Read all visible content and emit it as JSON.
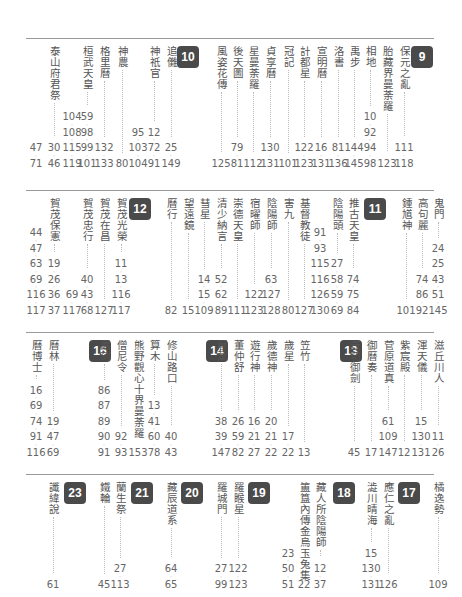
{
  "sections": [
    {
      "top": 38,
      "height": 135,
      "badges": [
        {
          "label": "10",
          "x": 151
        },
        {
          "label": "9",
          "x": 385
        }
      ],
      "entries": [
        {
          "term": "",
          "x": 4,
          "pages": [
            "47",
            "71"
          ]
        },
        {
          "term": "泰山府君祭",
          "x": 22,
          "pages": [
            "30",
            "46"
          ]
        },
        {
          "term": "",
          "x": 40,
          "pages": [
            "104",
            "108",
            "115",
            "119"
          ]
        },
        {
          "term": "桓武天皇",
          "x": 55,
          "pages": [
            "59",
            "98",
            "99",
            "101"
          ]
        },
        {
          "term": "格里曆",
          "x": 72,
          "pages": [
            "132",
            "133"
          ]
        },
        {
          "term": "神農",
          "x": 90,
          "pages": [
            "80"
          ]
        },
        {
          "term": "",
          "x": 106,
          "pages": [
            "95",
            "103",
            "104"
          ]
        },
        {
          "term": "神祇官",
          "x": 122,
          "pages": [
            "12",
            "72",
            "91"
          ]
        },
        {
          "term": "追儺",
          "x": 139,
          "pages": [
            "25",
            "149"
          ]
        },
        {
          "term": "風姿花傳",
          "x": 189,
          "pages": [
            "125"
          ]
        },
        {
          "term": "後天圖",
          "x": 205,
          "pages": [
            "79",
            "81"
          ]
        },
        {
          "term": "星曼荼羅",
          "x": 221,
          "pages": [
            "112"
          ]
        },
        {
          "term": "貞享曆",
          "x": 238,
          "pages": [
            "130",
            "131"
          ]
        },
        {
          "term": "冠記",
          "x": 256,
          "pages": [
            "101"
          ]
        },
        {
          "term": "計都星",
          "x": 272,
          "pages": [
            "122",
            "123"
          ]
        },
        {
          "term": "宣明曆",
          "x": 289,
          "pages": [
            "16",
            "131"
          ]
        },
        {
          "term": "洛書",
          "x": 306,
          "pages": [
            "81",
            "136"
          ]
        },
        {
          "term": "禹步",
          "x": 322,
          "pages": [
            "144",
            "145"
          ]
        },
        {
          "term": "相地",
          "x": 338,
          "pages": [
            "10",
            "92",
            "94",
            "98"
          ]
        },
        {
          "term": "胎藏界曼荼羅",
          "x": 355,
          "pages": [
            "123"
          ]
        },
        {
          "term": "保元之亂",
          "x": 372,
          "pages": [
            "111",
            "118"
          ]
        }
      ]
    },
    {
      "top": 190,
      "height": 130,
      "badges": [
        {
          "label": "12",
          "x": 103
        },
        {
          "label": "11",
          "x": 338
        }
      ],
      "entries": [
        {
          "term": "",
          "x": 4,
          "pages": [
            "44",
            "47",
            "63",
            "69",
            "116",
            "117"
          ]
        },
        {
          "term": "賀茂保憲",
          "x": 22,
          "pages": [
            "19",
            "26",
            "36",
            "37"
          ]
        },
        {
          "term": "",
          "x": 40,
          "pages": [
            "69",
            "117"
          ]
        },
        {
          "term": "賀茂忠行",
          "x": 55,
          "pages": [
            "40",
            "43",
            "68"
          ]
        },
        {
          "term": "賀茂在昌",
          "x": 72,
          "pages": [
            "127"
          ]
        },
        {
          "term": "賀茂光榮",
          "x": 89,
          "pages": [
            "11",
            "13",
            "116",
            "117"
          ]
        },
        {
          "term": "曆行",
          "x": 139,
          "pages": [
            "82"
          ]
        },
        {
          "term": "望遠鏡",
          "x": 156,
          "pages": [
            "15"
          ]
        },
        {
          "term": "彗星",
          "x": 172,
          "pages": [
            "14",
            "15",
            "109"
          ]
        },
        {
          "term": "清少納言",
          "x": 189,
          "pages": [
            "52",
            "62",
            "89"
          ]
        },
        {
          "term": "崇德天皇",
          "x": 205,
          "pages": [
            "111"
          ]
        },
        {
          "term": "宿曜師",
          "x": 222,
          "pages": [
            "122",
            "123"
          ]
        },
        {
          "term": "陰陽師",
          "x": 239,
          "pages": [
            "63",
            "127",
            "128"
          ]
        },
        {
          "term": "害九",
          "x": 256,
          "pages": [
            "80"
          ]
        },
        {
          "term": "基督教徒",
          "x": 272,
          "pages": [
            "127"
          ]
        },
        {
          "term": "",
          "x": 288,
          "pages": [
            "91",
            "93",
            "115",
            "116",
            "126",
            "130"
          ]
        },
        {
          "term": "陰陽頭",
          "x": 305,
          "pages": [
            "27",
            "58",
            "59",
            "69"
          ]
        },
        {
          "term": "推古天皇",
          "x": 321,
          "pages": [
            "74",
            "75",
            "84"
          ]
        },
        {
          "term": "鍾馗神",
          "x": 374,
          "pages": [
            "101"
          ]
        },
        {
          "term": "高句麗",
          "x": 390,
          "pages": [
            "74",
            "86",
            "92"
          ]
        },
        {
          "term": "鬼門",
          "x": 406,
          "pages": [
            "24",
            "25",
            "43",
            "51",
            "145"
          ]
        }
      ]
    },
    {
      "top": 332,
      "height": 130,
      "badges": [
        {
          "label": "16",
          "x": 63
        },
        {
          "label": "14",
          "x": 180
        },
        {
          "label": "13",
          "x": 314
        }
      ],
      "entries": [
        {
          "term": "曆博士",
          "x": 4,
          "pages": [
            "16",
            "69",
            "74",
            "91",
            "116"
          ]
        },
        {
          "term": "曆林",
          "x": 21,
          "pages": [
            "19",
            "47",
            "69"
          ]
        },
        {
          "term": "漏刻",
          "x": 72,
          "pages": [
            "86",
            "87",
            "89",
            "90",
            "91"
          ]
        },
        {
          "term": "僧尼令",
          "x": 89,
          "pages": [
            "92",
            "93"
          ]
        },
        {
          "term": "熊野觀心十界曼荼羅",
          "x": 106,
          "pages": [
            "153"
          ]
        },
        {
          "term": "算木",
          "x": 122,
          "pages": [
            "13",
            "41",
            "60",
            "78"
          ]
        },
        {
          "term": "修山路口",
          "x": 139,
          "pages": [
            "40",
            "43"
          ]
        },
        {
          "term": "曆葉",
          "x": 189,
          "pages": [
            "38",
            "39",
            "147"
          ]
        },
        {
          "term": "董仲舒",
          "x": 206,
          "pages": [
            "26",
            "59",
            "82"
          ]
        },
        {
          "term": "遊行神",
          "x": 222,
          "pages": [
            "16",
            "21",
            "27"
          ]
        },
        {
          "term": "歲德神",
          "x": 239,
          "pages": [
            "20",
            "21",
            "22"
          ]
        },
        {
          "term": "歲星",
          "x": 256,
          "pages": [
            "17",
            "22"
          ]
        },
        {
          "term": "笠竹",
          "x": 272,
          "pages": [
            "13"
          ]
        },
        {
          "term": "壺切御劍",
          "x": 322,
          "pages": [
            "45"
          ]
        },
        {
          "term": "御曆奏",
          "x": 339,
          "pages": [
            "17"
          ]
        },
        {
          "term": "菅原道真",
          "x": 356,
          "pages": [
            "61",
            "109",
            "147"
          ]
        },
        {
          "term": "紫宸殿",
          "x": 372,
          "pages": [
            "12"
          ]
        },
        {
          "term": "渾天儀",
          "x": 389,
          "pages": [
            "15",
            "130",
            "131"
          ]
        },
        {
          "term": "滋丘川人",
          "x": 406,
          "pages": [
            "11",
            "26"
          ]
        }
      ]
    },
    {
      "top": 474,
      "height": 120,
      "badges": [
        {
          "label": "23",
          "x": 38
        },
        {
          "label": "21",
          "x": 105
        },
        {
          "label": "20",
          "x": 155
        },
        {
          "label": "19",
          "x": 222
        },
        {
          "label": "18",
          "x": 307
        },
        {
          "label": "17",
          "x": 372
        }
      ],
      "entries": [
        {
          "term": "讖緯說",
          "x": 21,
          "pages": [
            "61"
          ]
        },
        {
          "term": "鐵輪",
          "x": 72,
          "pages": [
            "45"
          ]
        },
        {
          "term": "蘭生祭",
          "x": 88,
          "pages": [
            "27",
            "113"
          ]
        },
        {
          "term": "藏辰道系",
          "x": 139,
          "pages": [
            "64",
            "65"
          ]
        },
        {
          "term": "羅城門",
          "x": 189,
          "pages": [
            "27",
            "99"
          ]
        },
        {
          "term": "羅睺星",
          "x": 206,
          "pages": [
            "122",
            "123"
          ]
        },
        {
          "term": "",
          "x": 256,
          "pages": [
            "23",
            "50",
            "51"
          ]
        },
        {
          "term": "簠簋內傳金烏玉兔集",
          "x": 272,
          "pages": [
            "22"
          ]
        },
        {
          "term": "藏人所陰陽師",
          "x": 288,
          "pages": [
            "12",
            "37"
          ]
        },
        {
          "term": "澁川晴海",
          "x": 339,
          "pages": [
            "15",
            "130",
            "131"
          ]
        },
        {
          "term": "應仁之亂",
          "x": 356,
          "pages": [
            "126"
          ]
        },
        {
          "term": "橘逸勢",
          "x": 406,
          "pages": [
            "109"
          ]
        }
      ]
    }
  ]
}
